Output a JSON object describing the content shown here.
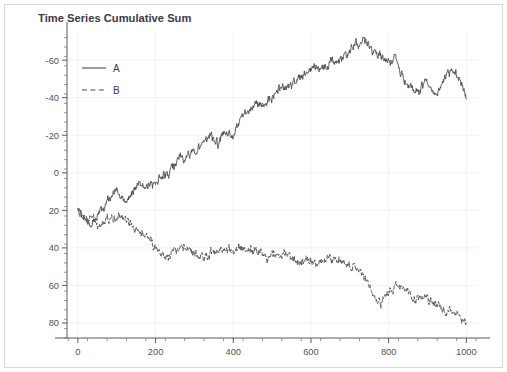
{
  "figure": {
    "title": "Time Series Cumulative Sum",
    "background": "#ffffff",
    "frame_color": "#d8d8d8"
  },
  "legend": {
    "position": "upper-left",
    "entries": [
      {
        "label": "A",
        "style": "solid",
        "color": "#4d4d4d"
      },
      {
        "label": "B",
        "style": "dashed",
        "color": "#4d4d4d"
      }
    ]
  },
  "axes": {
    "x_ticks": [
      "0",
      "200",
      "400",
      "600",
      "800",
      "1000"
    ],
    "y_ticks": [
      "80",
      "60",
      "40",
      "20",
      "0",
      "-20",
      "-40",
      "-60"
    ],
    "x_minor_step": 50,
    "y_minor_step": 5,
    "grid": true,
    "tick_color": "#5a5a5a",
    "label_color": "#555555"
  },
  "chart_data": {
    "type": "line",
    "title": "Time Series Cumulative Sum",
    "xlabel": "",
    "ylabel": "",
    "xlim": [
      -28,
      1030
    ],
    "ylim": [
      -68,
      95
    ],
    "grid": true,
    "legend_position": "upper-left",
    "x_ticks": [
      0,
      200,
      400,
      600,
      800,
      1000
    ],
    "y_ticks": [
      -60,
      -40,
      -20,
      0,
      20,
      40,
      60,
      80
    ],
    "x": [
      0,
      1000
    ],
    "series": [
      {
        "name": "A",
        "style": "solid",
        "color": "#4d4d4d",
        "seed": 20172,
        "noise": 1.05,
        "control_x": [
          0,
          10,
          20,
          30,
          40,
          50,
          60,
          70,
          80,
          90,
          100,
          110,
          120,
          130,
          140,
          150,
          160,
          170,
          180,
          190,
          200,
          215,
          230,
          245,
          260,
          275,
          290,
          300,
          310,
          325,
          340,
          350,
          360,
          375,
          390,
          400,
          410,
          420,
          435,
          450,
          465,
          480,
          495,
          510,
          525,
          540,
          555,
          570,
          585,
          600,
          615,
          630,
          645,
          660,
          675,
          690,
          705,
          715,
          725,
          735,
          745,
          755,
          765,
          775,
          785,
          795,
          805,
          815,
          825,
          835,
          845,
          855,
          865,
          875,
          885,
          895,
          905,
          915,
          925,
          935,
          945,
          955,
          965,
          975,
          985,
          995,
          1000
        ],
        "control_y": [
          1,
          -3,
          -6,
          -8,
          -6,
          -3,
          1,
          3,
          5,
          9,
          11,
          8,
          5,
          6,
          9,
          13,
          14,
          13,
          14,
          15,
          15,
          17,
          20,
          23,
          27,
          27,
          30,
          32,
          34,
          37,
          40,
          37,
          35,
          41,
          40,
          39,
          45,
          51,
          52,
          55,
          57,
          58,
          60,
          64,
          65,
          66,
          67,
          70,
          73,
          75,
          76,
          77,
          79,
          80,
          80,
          82,
          86,
          88,
          89,
          91,
          90,
          87,
          84,
          82,
          81,
          80,
          79,
          80,
          77,
          72,
          68,
          64,
          63,
          62,
          66,
          70,
          67,
          63,
          62,
          66,
          70,
          73,
          74,
          73,
          70,
          64,
          60
        ],
        "start_value": 1,
        "end_value": 60,
        "max_value": 91,
        "min_value": -8
      },
      {
        "name": "B",
        "style": "dashed",
        "color": "#4d4d4d",
        "seed": 90413,
        "noise": 1.0,
        "control_x": [
          0,
          10,
          20,
          30,
          40,
          50,
          60,
          70,
          80,
          90,
          100,
          110,
          120,
          130,
          140,
          150,
          160,
          170,
          180,
          190,
          200,
          215,
          230,
          245,
          260,
          275,
          290,
          300,
          310,
          325,
          340,
          350,
          360,
          375,
          390,
          400,
          410,
          420,
          435,
          450,
          465,
          480,
          495,
          510,
          525,
          540,
          555,
          570,
          585,
          600,
          615,
          630,
          645,
          660,
          675,
          690,
          700,
          710,
          720,
          730,
          740,
          750,
          760,
          770,
          780,
          790,
          800,
          810,
          820,
          830,
          840,
          855,
          870,
          885,
          900,
          915,
          930,
          945,
          960,
          975,
          990,
          1000
        ],
        "control_y": [
          0,
          -2,
          -4,
          -3,
          -5,
          -7,
          -7,
          -6,
          -6,
          -5,
          -4,
          -5,
          -4,
          -6,
          -9,
          -11,
          -12,
          -13,
          -15,
          -17,
          -20,
          -23,
          -24,
          -22,
          -21,
          -19,
          -21,
          -23,
          -25,
          -25,
          -23,
          -21,
          -22,
          -20,
          -22,
          -23,
          -21,
          -19,
          -20,
          -21,
          -22,
          -24,
          -25,
          -24,
          -23,
          -24,
          -26,
          -28,
          -27,
          -26,
          -27,
          -28,
          -26,
          -25,
          -27,
          -29,
          -30,
          -29,
          -31,
          -33,
          -37,
          -41,
          -45,
          -48,
          -49,
          -46,
          -44,
          -43,
          -41,
          -40,
          -42,
          -45,
          -47,
          -46,
          -45,
          -49,
          -52,
          -54,
          -53,
          -55,
          -57,
          -61
        ],
        "start_value": 0,
        "end_value": -61,
        "max_value": 0,
        "min_value": -61
      }
    ]
  }
}
